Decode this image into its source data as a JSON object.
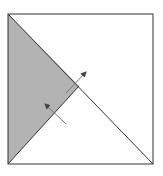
{
  "diagram": {
    "colors": {
      "background": "#ffffff",
      "stroke": "#333333",
      "shade": "#b3b3b3",
      "arrow": "#555555"
    },
    "square": {
      "x1": 8,
      "y1": 14,
      "x2": 153,
      "y2": 164
    },
    "center": {
      "x": 79,
      "y": 86
    },
    "arrows": [
      {
        "name": "outward-arrow",
        "from": [
          66,
          93
        ],
        "to": [
          86,
          72
        ]
      },
      {
        "name": "inward-arrow",
        "from": [
          66,
          124
        ],
        "to": [
          44,
          103
        ]
      }
    ]
  }
}
